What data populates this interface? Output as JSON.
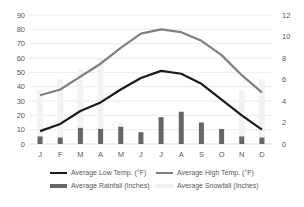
{
  "chart_data": {
    "type": "bar+line",
    "title": "",
    "categories": [
      "J",
      "F",
      "M",
      "A",
      "M",
      "J",
      "J",
      "A",
      "S",
      "O",
      "N",
      "D"
    ],
    "left_axis": {
      "label": "",
      "ticks": [
        0,
        10,
        20,
        30,
        40,
        50,
        60,
        70,
        80,
        90
      ],
      "range": [
        0,
        90
      ]
    },
    "right_axis": {
      "label": "",
      "ticks": [
        0,
        2,
        4,
        6,
        8,
        10,
        12
      ],
      "range": [
        0,
        12
      ]
    },
    "grid": true,
    "legend_position": "bottom",
    "series": [
      {
        "name": "Average Low Temp. (°F)",
        "type": "line",
        "axis": "left",
        "color": "#1a1a1a",
        "values": [
          9,
          14,
          23,
          29,
          38,
          46,
          51,
          49,
          42,
          31,
          20,
          10
        ]
      },
      {
        "name": "Average High Temp. (°F)",
        "type": "line",
        "axis": "left",
        "color": "#7f7f7f",
        "values": [
          34,
          38,
          47,
          56,
          67,
          77,
          80,
          78,
          72,
          62,
          48,
          36
        ]
      },
      {
        "name": "Average Rainfall (Inches)",
        "type": "bar",
        "axis": "right",
        "color": "#666666",
        "values": [
          0.7,
          0.6,
          1.5,
          1.4,
          1.6,
          1.1,
          2.5,
          3.0,
          2.0,
          1.4,
          0.7,
          0.6
        ]
      },
      {
        "name": "Average Snowfall (Inches)",
        "type": "bar",
        "axis": "right",
        "color": "#f2f2f2",
        "values": [
          5,
          6,
          7,
          8,
          2,
          0,
          0,
          0,
          0,
          1,
          5,
          6
        ]
      }
    ]
  },
  "legend": {
    "low": "Average Low Temp. (°F)",
    "high": "Average High Temp. (°F)",
    "rain": "Average Rainfall (Inches)",
    "snow": "Average Snowfall (Inches)"
  }
}
